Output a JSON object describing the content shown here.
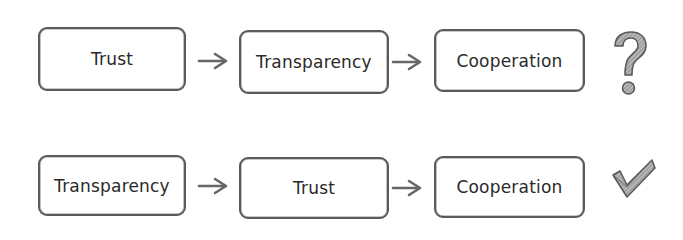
{
  "diagram": {
    "rows": [
      {
        "id": "hypothesis",
        "steps": [
          {
            "label": "Trust"
          },
          {
            "label": "Transparency"
          },
          {
            "label": "Cooperation"
          }
        ],
        "verdict": {
          "icon": "question-mark-icon",
          "meaning": "uncertain"
        }
      },
      {
        "id": "corrected",
        "steps": [
          {
            "label": "Transparency"
          },
          {
            "label": "Trust"
          },
          {
            "label": "Cooperation"
          }
        ],
        "verdict": {
          "icon": "checkmark-icon",
          "meaning": "correct"
        }
      }
    ],
    "colors": {
      "stroke": "#5a5a5a",
      "text": "#2a2a2a",
      "arrow": "#666666",
      "verdict_fill": "#9a9a9a"
    }
  }
}
